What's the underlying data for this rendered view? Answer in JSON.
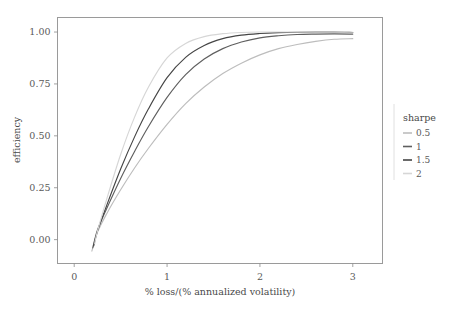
{
  "chart_data": {
    "type": "line",
    "title": "",
    "xlabel": "% loss/(% annualized volatility)",
    "ylabel": "efficiency",
    "xlim": [
      -0.18,
      3.32
    ],
    "ylim": [
      -0.115,
      1.07
    ],
    "xticks": [
      0,
      1,
      2,
      3
    ],
    "xtick_labels": [
      "0",
      "1",
      "2",
      "3"
    ],
    "yticks": [
      0.0,
      0.25,
      0.5,
      0.75,
      1.0
    ],
    "ytick_labels": [
      "0.00",
      "0.25",
      "0.50",
      "0.75",
      "1.00"
    ],
    "grid": false,
    "legend_position": "right",
    "legend_title": "sharpe",
    "series": [
      {
        "name": "0.5",
        "color": "#bdbdbd",
        "x": [
          0.19,
          0.25,
          0.35,
          0.5,
          0.65,
          0.8,
          1.0,
          1.2,
          1.4,
          1.6,
          1.8,
          2.0,
          2.2,
          2.4,
          2.6,
          2.8,
          3.0
        ],
        "y": [
          -0.055,
          0.035,
          0.125,
          0.24,
          0.345,
          0.44,
          0.555,
          0.655,
          0.735,
          0.8,
          0.85,
          0.89,
          0.92,
          0.94,
          0.955,
          0.965,
          0.968
        ]
      },
      {
        "name": "1",
        "color": "#5f5f5f",
        "x": [
          0.2,
          0.25,
          0.35,
          0.5,
          0.65,
          0.8,
          1.0,
          1.2,
          1.4,
          1.6,
          1.8,
          2.0,
          2.2,
          2.4,
          2.6,
          2.8,
          3.0
        ],
        "y": [
          -0.04,
          0.045,
          0.15,
          0.295,
          0.425,
          0.545,
          0.685,
          0.795,
          0.87,
          0.92,
          0.952,
          0.972,
          0.982,
          0.988,
          0.99,
          0.991,
          0.99
        ]
      },
      {
        "name": "1.5",
        "color": "#454545",
        "x": [
          0.21,
          0.25,
          0.35,
          0.5,
          0.65,
          0.8,
          1.0,
          1.2,
          1.4,
          1.6,
          1.8,
          2.0,
          2.2,
          2.4,
          2.6,
          2.8,
          3.0
        ],
        "y": [
          -0.03,
          0.04,
          0.165,
          0.34,
          0.495,
          0.63,
          0.78,
          0.878,
          0.935,
          0.968,
          0.985,
          0.993,
          0.997,
          0.999,
          1.0,
          1.0,
          0.998
        ]
      },
      {
        "name": "2",
        "color": "#d6d6d6",
        "x": [
          0.22,
          0.25,
          0.35,
          0.5,
          0.65,
          0.8,
          1.0,
          1.2,
          1.4,
          1.6,
          1.8,
          2.0,
          2.2,
          2.4,
          2.6,
          2.8,
          3.0
        ],
        "y": [
          -0.02,
          0.04,
          0.195,
          0.41,
          0.59,
          0.735,
          0.875,
          0.945,
          0.978,
          0.992,
          0.998,
          1.0,
          1.0,
          1.0,
          1.0,
          1.0,
          0.999
        ]
      }
    ]
  },
  "legend": {
    "title": "sharpe",
    "entries": [
      {
        "label": "0.5",
        "color": "#bdbdbd"
      },
      {
        "label": "1",
        "color": "#5f5f5f"
      },
      {
        "label": "1.5",
        "color": "#454545"
      },
      {
        "label": "2",
        "color": "#d6d6d6"
      }
    ]
  },
  "axes": {
    "x_title": "% loss/(% annualized volatility)",
    "y_title": "efficiency",
    "x_tick_labels": [
      "0",
      "1",
      "2",
      "3"
    ],
    "y_tick_labels": [
      "0.00",
      "0.25",
      "0.50",
      "0.75",
      "1.00"
    ]
  },
  "colors": {
    "panel_background": "#ffffff",
    "panel_border": "#9a9a9a",
    "text": "#4a4a4a",
    "tick": "#8a8a8a"
  }
}
